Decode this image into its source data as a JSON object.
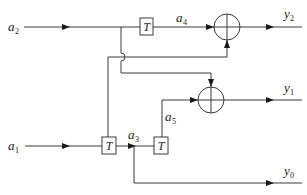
{
  "diagram": {
    "type": "signal-flow block diagram",
    "inputs": [
      {
        "id": "a2",
        "base": "a",
        "sub": "2"
      },
      {
        "id": "a1",
        "base": "a",
        "sub": "1"
      }
    ],
    "internal_signals": [
      {
        "id": "a4",
        "base": "a",
        "sub": "4"
      },
      {
        "id": "a3",
        "base": "a",
        "sub": "3"
      },
      {
        "id": "a5",
        "base": "a",
        "sub": "5"
      }
    ],
    "outputs": [
      {
        "id": "y2",
        "base": "y",
        "sub": "2"
      },
      {
        "id": "y1",
        "base": "y",
        "sub": "1"
      },
      {
        "id": "y0",
        "base": "y",
        "sub": "0"
      }
    ],
    "delay_blocks": [
      {
        "id": "delay-top",
        "label": "T"
      },
      {
        "id": "delay-bottom-left",
        "label": "T"
      },
      {
        "id": "delay-bottom-right",
        "label": "T"
      }
    ],
    "adders": [
      {
        "id": "adder-y2",
        "symbol": "+"
      },
      {
        "id": "adder-y1",
        "symbol": "+"
      }
    ],
    "colors": {
      "line": "#3a3a3a",
      "arrow": "#1a1a1a",
      "background": "#ffffff"
    }
  }
}
